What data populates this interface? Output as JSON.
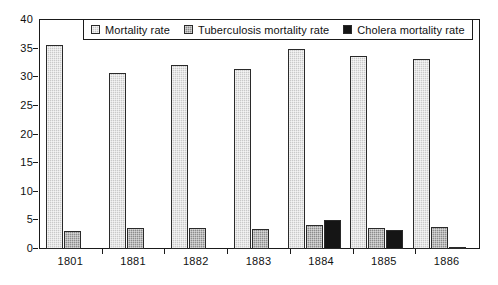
{
  "chart_data": {
    "type": "bar",
    "title": "",
    "subtitle": "",
    "xlabel": "",
    "ylabel": "",
    "categories": [
      "1801",
      "1881",
      "1882",
      "1883",
      "1884",
      "1885",
      "1886"
    ],
    "series": [
      {
        "name": "Mortality rate",
        "key": "mortality",
        "color": "#c9c9c9",
        "values": [
          35.6,
          30.7,
          32.1,
          31.5,
          34.9,
          33.8,
          33.2
        ]
      },
      {
        "name": "Tuberculosis mortality rate",
        "key": "tuberculosis",
        "color": "#8c8c8c",
        "values": [
          3.1,
          3.7,
          3.7,
          3.5,
          4.2,
          3.7,
          3.8
        ]
      },
      {
        "name": "Cholera mortality rate",
        "key": "cholera",
        "color": "#151515",
        "values": [
          0,
          0,
          0,
          0,
          5.0,
          3.3,
          0.3
        ]
      }
    ],
    "ylim": [
      0,
      40
    ],
    "ytick_step": 5,
    "yticks": [
      "40",
      "35",
      "30",
      "25",
      "20",
      "15",
      "10",
      "5",
      "0"
    ],
    "grid": false,
    "legend_position": "top-center"
  },
  "legend": {
    "entries": [
      {
        "label": "Mortality rate",
        "icon": "legend-swatch-mortality"
      },
      {
        "label": "Tuberculosis mortality rate",
        "icon": "legend-swatch-tuberculosis"
      },
      {
        "label": "Cholera mortality rate",
        "icon": "legend-swatch-cholera"
      }
    ]
  }
}
